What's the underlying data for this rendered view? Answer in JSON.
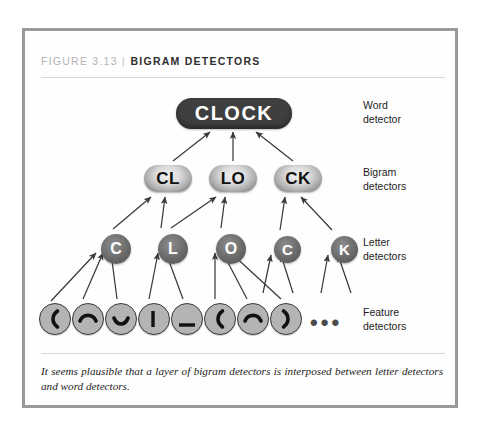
{
  "figure": {
    "number": "FIGURE 3.13",
    "separator": "|",
    "title": "BIGRAM DETECTORS",
    "caption": "It seems plausible that a layer of bigram detectors is interposed between letter detectors and word detectors."
  },
  "colors": {
    "frame_border": "#9a9a9a",
    "rule": "#d6d6d6",
    "figure_number": "#b3b3b3",
    "figure_title": "#2e2e2e",
    "word_node_fill": "#3f3f3f",
    "word_node_text": "#ffffff",
    "bigram_node_text": "#111111",
    "letter_node_text": "#ffffff",
    "feature_node_fill": "#b4b4b4",
    "feature_node_stroke": "#3d3d3d",
    "arrow": "#3a3a3a",
    "label_text": "#1d1d1d"
  },
  "diagram": {
    "word_layer": {
      "label": "Word\ndetector",
      "nodes": [
        {
          "id": "word-clock",
          "text": "CLOCK",
          "x": 151,
          "y": 67,
          "w": 116,
          "h": 31
        }
      ]
    },
    "bigram_layer": {
      "label": "Bigram\ndetectors",
      "nodes": [
        {
          "id": "bigram-cl",
          "text": "CL",
          "x": 119,
          "y": 134,
          "w": 48,
          "h": 27
        },
        {
          "id": "bigram-lo",
          "text": "LO",
          "x": 184,
          "y": 134,
          "w": 48,
          "h": 27
        },
        {
          "id": "bigram-ck",
          "text": "CK",
          "x": 249,
          "y": 134,
          "w": 48,
          "h": 27
        }
      ]
    },
    "letter_layer": {
      "label": "Letter\ndetectors",
      "nodes": [
        {
          "id": "letter-c1",
          "text": "C",
          "x": 76,
          "y": 203,
          "d": 30
        },
        {
          "id": "letter-l",
          "text": "L",
          "x": 133,
          "y": 203,
          "d": 30
        },
        {
          "id": "letter-o",
          "text": "O",
          "x": 191,
          "y": 203,
          "d": 30
        },
        {
          "id": "letter-c2",
          "text": "C",
          "x": 249,
          "y": 205,
          "d": 27
        },
        {
          "id": "letter-k",
          "text": "K",
          "x": 306,
          "y": 205,
          "d": 27
        }
      ]
    },
    "feature_layer": {
      "label": "Feature\ndetectors",
      "ellipsis": "•••",
      "nodes": [
        {
          "id": "feature-1",
          "glyph": "left-paren-feature-icon",
          "x": 14,
          "y": 272,
          "d": 32
        },
        {
          "id": "feature-2",
          "glyph": "arc-up-feature-icon",
          "x": 47,
          "y": 272,
          "d": 32
        },
        {
          "id": "feature-3",
          "glyph": "arc-down-feature-icon",
          "x": 80,
          "y": 272,
          "d": 32
        },
        {
          "id": "feature-4",
          "glyph": "vertical-bar-feature-icon",
          "x": 113,
          "y": 272,
          "d": 32
        },
        {
          "id": "feature-5",
          "glyph": "underscore-feature-icon",
          "x": 146,
          "y": 272,
          "d": 32
        },
        {
          "id": "feature-6",
          "glyph": "left-paren-feature-icon",
          "x": 179,
          "y": 272,
          "d": 32
        },
        {
          "id": "feature-7",
          "glyph": "arc-up-feature-icon",
          "x": 212,
          "y": 272,
          "d": 32
        },
        {
          "id": "feature-8",
          "glyph": "right-paren-feature-icon",
          "x": 245,
          "y": 272,
          "d": 32
        }
      ]
    }
  }
}
